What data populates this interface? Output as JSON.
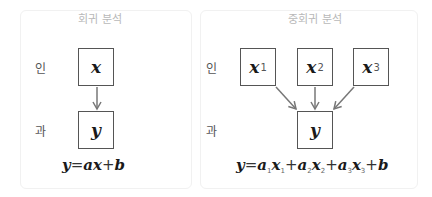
{
  "simple": {
    "title": "회귀 분석",
    "cause_label": "인",
    "effect_label": "과",
    "input": {
      "var": "x"
    },
    "output": {
      "var": "y"
    },
    "equation": {
      "lhs": "y",
      "eq": "=",
      "a": "a",
      "x": "x",
      "plus": "+",
      "b": "b"
    }
  },
  "multiple": {
    "title": "중회귀 분석",
    "cause_label": "인",
    "effect_label": "과",
    "inputs": [
      {
        "var": "x",
        "sub": "1"
      },
      {
        "var": "x",
        "sub": "2"
      },
      {
        "var": "x",
        "sub": "3"
      }
    ],
    "output": {
      "var": "y"
    },
    "equation": {
      "lhs": "y",
      "eq": "=",
      "terms": [
        {
          "a": "a",
          "asub": "1",
          "x": "x",
          "xsub": "1"
        },
        {
          "a": "a",
          "asub": "2",
          "x": "x",
          "xsub": "2"
        },
        {
          "a": "a",
          "asub": "3",
          "x": "x",
          "xsub": "3"
        }
      ],
      "plus": "+",
      "b": "b"
    }
  },
  "colors": {
    "arrow": "#777777",
    "box_border": "#555555",
    "title": "#b8b8b8"
  }
}
